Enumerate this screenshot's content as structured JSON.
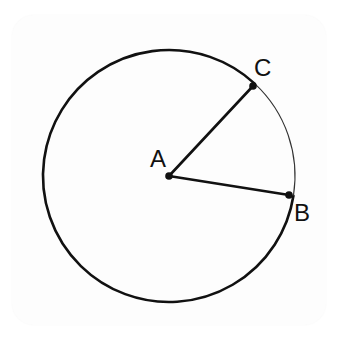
{
  "diagram": {
    "type": "circle-sector",
    "colors": {
      "stroke": "#111111",
      "background": "#ffffff",
      "card": "#fdfdfd"
    },
    "circle": {
      "center_label": "A",
      "cx": 169,
      "cy": 176,
      "r": 126
    },
    "points": [
      {
        "id": "A",
        "label": "A",
        "x": 169,
        "y": 176,
        "label_x": 150,
        "label_y": 167
      },
      {
        "id": "B",
        "label": "B",
        "x": 289,
        "y": 195,
        "label_x": 294,
        "label_y": 221
      },
      {
        "id": "C",
        "label": "C",
        "x": 253,
        "y": 86,
        "label_x": 254,
        "label_y": 76
      }
    ],
    "segments": [
      {
        "from": "A",
        "to": "C"
      },
      {
        "from": "A",
        "to": "B"
      }
    ],
    "arcs": [
      {
        "name": "minor-arc-CB",
        "from": "C",
        "to": "B",
        "weight": "thin"
      },
      {
        "name": "major-arc-BC",
        "from": "B",
        "to": "C",
        "weight": "thick"
      }
    ]
  }
}
